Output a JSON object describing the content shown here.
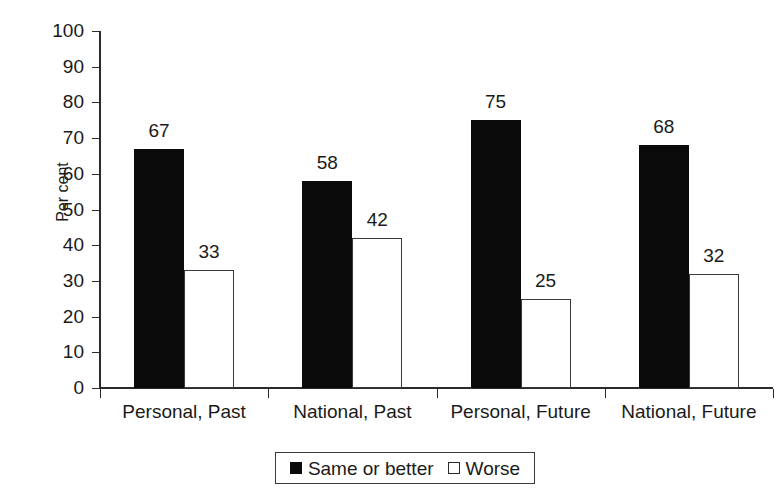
{
  "chart_data": {
    "type": "bar",
    "title": "",
    "xlabel": "",
    "ylabel": "Per cent",
    "ylim": [
      0,
      100
    ],
    "ytick_step": 10,
    "yticks": [
      100,
      90,
      80,
      70,
      60,
      50,
      40,
      30,
      20,
      10,
      0
    ],
    "grid": false,
    "legend_position": "bottom",
    "categories": [
      "Personal, Past",
      "National, Past",
      "Personal, Future",
      "National, Future"
    ],
    "series": [
      {
        "name": "Same or better",
        "swatch": "filled-square",
        "color": "#0a0a0a",
        "values": [
          67,
          58,
          75,
          68
        ]
      },
      {
        "name": "Worse",
        "swatch": "open-square",
        "color": "#ffffff",
        "values": [
          33,
          42,
          25,
          32
        ]
      }
    ],
    "data_labels": [
      {
        "category": "Personal, Past",
        "series": "Same or better",
        "value": "67"
      },
      {
        "category": "Personal, Past",
        "series": "Worse",
        "value": "33"
      },
      {
        "category": "National, Past",
        "series": "Same or better",
        "value": "58"
      },
      {
        "category": "National, Past",
        "series": "Worse",
        "value": "42"
      },
      {
        "category": "Personal, Future",
        "series": "Same or better",
        "value": "75"
      },
      {
        "category": "Personal, Future",
        "series": "Worse",
        "value": "25"
      },
      {
        "category": "National, Future",
        "series": "Same or better",
        "value": "68"
      },
      {
        "category": "National, Future",
        "series": "Worse",
        "value": "32"
      }
    ]
  },
  "axis": {
    "y_title": "Per cent",
    "y_labels": [
      "100",
      "90",
      "80",
      "70",
      "60",
      "50",
      "40",
      "30",
      "20",
      "10",
      "0"
    ]
  },
  "legend": {
    "entries": [
      {
        "label": "Same or better"
      },
      {
        "label": "Worse"
      }
    ]
  },
  "colors": {
    "bar_dark": "#0a0a0a",
    "bar_light": "#ffffff",
    "bar_light_stroke": "#3a3a3a",
    "axis": "#2b2b2b",
    "text": "#1a1a1a",
    "background": "#ffffff"
  }
}
